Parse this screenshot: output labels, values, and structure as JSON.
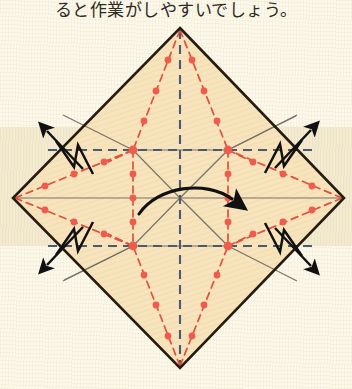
{
  "page": {
    "width": 352,
    "height": 389,
    "background_color": "#fcf8ea",
    "band_color": "#f3ead0",
    "band_top": 127,
    "band_height": 119
  },
  "caption": {
    "text": "ると作業がしやすいでしょう。",
    "top": -4,
    "clipped": true
  },
  "colors": {
    "paper_fill": "#f7e3bc",
    "outline": "#241c10",
    "valley_red": "#e0503f",
    "dot_red": "#ef5b4c",
    "mountain_blue": "#4a5a70",
    "guide_gray": "#6e6a60",
    "arrow_black": "#111111"
  },
  "diagram": {
    "shape": "rotated-square-diamond",
    "vertices": {
      "top": [
        180,
        28
      ],
      "right": [
        344,
        198
      ],
      "bottom": [
        180,
        368
      ],
      "left": [
        13,
        198
      ]
    },
    "center": [
      180,
      198
    ],
    "inner_square": {
      "top_left": [
        133,
        150
      ],
      "top_right": [
        228,
        150
      ],
      "bottom_right": [
        228,
        246
      ],
      "bottom_left": [
        133,
        246
      ]
    },
    "line_legend": [
      {
        "name": "valley-fold",
        "style": "red dotted",
        "color": "#e0503f"
      },
      {
        "name": "mountain-fold",
        "style": "blue dashed",
        "color": "#4a5a70"
      },
      {
        "name": "existing-crease",
        "style": "gray solid",
        "color": "#6e6a60"
      },
      {
        "name": "paper-edge",
        "style": "black solid",
        "color": "#241c10"
      }
    ],
    "pleat_symbols": [
      {
        "name": "pleat-top-left",
        "arrow_direction": "up-left"
      },
      {
        "name": "pleat-top-right",
        "arrow_direction": "up-right"
      },
      {
        "name": "pleat-bottom-left",
        "arrow_direction": "down-left"
      },
      {
        "name": "pleat-bottom-right",
        "arrow_direction": "down-right"
      }
    ],
    "rotation_arrow": {
      "name": "center-curved-arrow",
      "direction": "left-to-right-curved"
    }
  }
}
